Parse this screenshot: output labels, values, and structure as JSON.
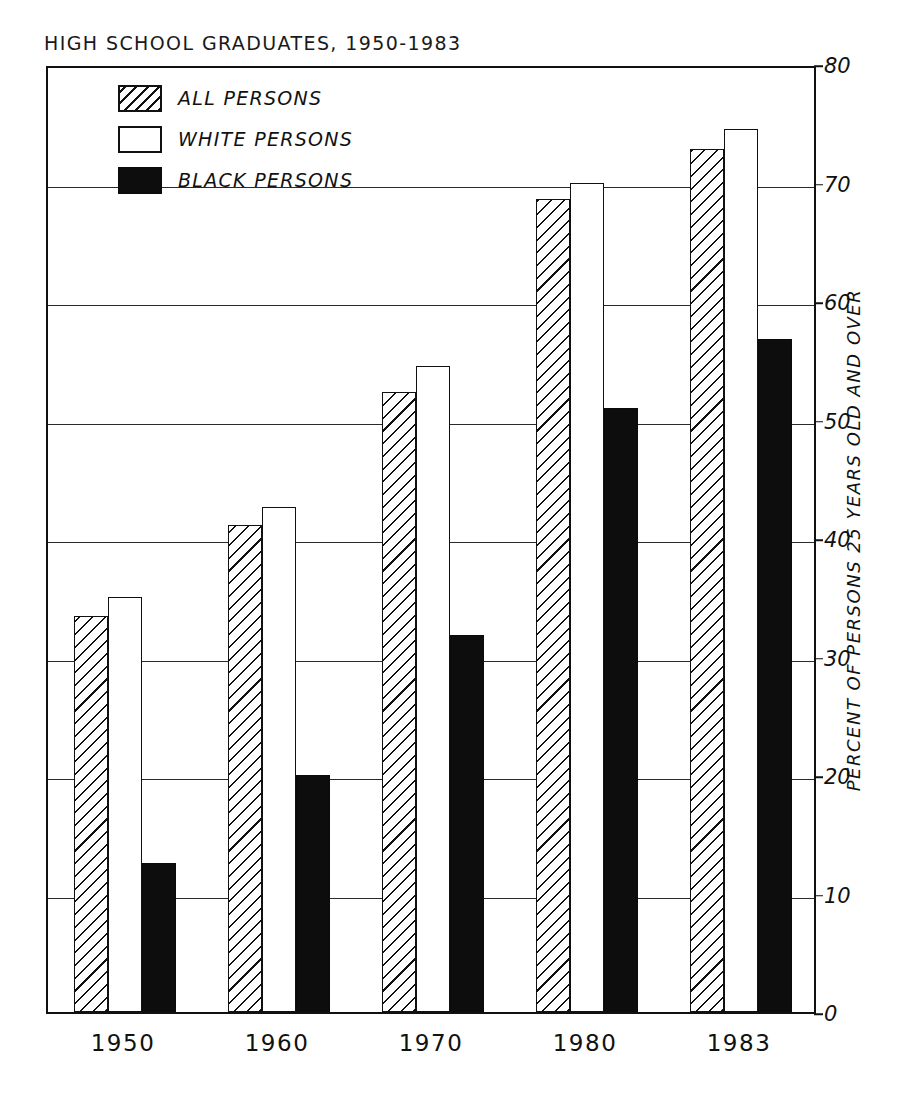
{
  "chart_data": {
    "type": "bar",
    "title": "HIGH SCHOOL GRADUATES, 1950-1983",
    "xlabel": "",
    "ylabel": "PERCENT OF PERSONS 25 YEARS OLD AND OVER",
    "categories": [
      "1950",
      "1960",
      "1970",
      "1980",
      "1983"
    ],
    "series": [
      {
        "name": "ALL PERSONS",
        "key": "all",
        "fill": "hatched",
        "values": [
          33.4,
          41.1,
          52.3,
          68.6,
          72.8
        ]
      },
      {
        "name": "WHITE PERSONS",
        "key": "white",
        "fill": "white-open",
        "values": [
          35.0,
          42.6,
          54.5,
          70.0,
          74.5
        ]
      },
      {
        "name": "BLACK PERSONS",
        "key": "black",
        "fill": "solid-black",
        "values": [
          12.6,
          20.0,
          31.8,
          51.0,
          56.8
        ]
      }
    ],
    "ylim": [
      0,
      80
    ],
    "yticks": [
      0,
      10,
      20,
      30,
      40,
      50,
      60,
      70,
      80
    ],
    "ytick_labels": [
      "0",
      "10",
      "20",
      "30",
      "40",
      "50",
      "60",
      "70",
      "80"
    ],
    "grid": true,
    "grid_axis": "y",
    "legend_position": "upper-left-inside",
    "colors": {
      "axis": "#111111",
      "grid": "#2a2a2a",
      "bar_all": "#ffffff",
      "bar_white": "#ffffff",
      "bar_black": "#0d0d0d",
      "background": "#ffffff"
    }
  },
  "legend": {
    "items": [
      {
        "label": "ALL PERSONS",
        "swatch": "hatched-swatch-icon"
      },
      {
        "label": "WHITE PERSONS",
        "swatch": "open-swatch-icon"
      },
      {
        "label": "BLACK PERSONS",
        "swatch": "filled-swatch-icon"
      }
    ]
  }
}
